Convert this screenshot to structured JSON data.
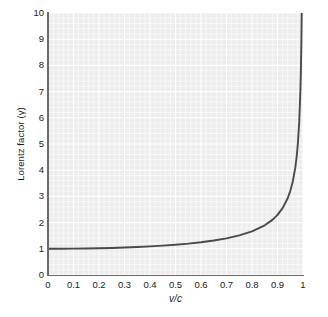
{
  "chart_data": {
    "type": "line",
    "title": "",
    "subtitle": "",
    "xlabel": "v/c",
    "ylabel": "Lorentz factor (γ)",
    "xlim": [
      0,
      1
    ],
    "ylim": [
      0,
      10
    ],
    "grid": true,
    "minor_grid": true,
    "legend": "none",
    "background_color": "#ededed",
    "line_color": "#4a4a4a",
    "axis_color": "#6b6b6b",
    "grid_color": "#ffffff",
    "xticks": [
      "0",
      "0.1",
      "0.2",
      "0.3",
      "0.4",
      "0.5",
      "0.6",
      "0.7",
      "0.8",
      "0.9",
      "1"
    ],
    "xtick_values": [
      0,
      0.1,
      0.2,
      0.3,
      0.4,
      0.5,
      0.6,
      0.7,
      0.8,
      0.9,
      1
    ],
    "yticks": [
      "0",
      "1",
      "2",
      "3",
      "4",
      "5",
      "6",
      "7",
      "8",
      "9",
      "10"
    ],
    "ytick_values": [
      0,
      1,
      2,
      3,
      4,
      5,
      6,
      7,
      8,
      9,
      10
    ],
    "series": [
      {
        "name": "Lorentz factor",
        "equation": "gamma = 1 / sqrt(1 - (v/c)^2)",
        "x": [
          0,
          0.05,
          0.1,
          0.15,
          0.2,
          0.25,
          0.3,
          0.35,
          0.4,
          0.45,
          0.5,
          0.55,
          0.6,
          0.65,
          0.7,
          0.75,
          0.8,
          0.85,
          0.88,
          0.9,
          0.92,
          0.94,
          0.95,
          0.96,
          0.97,
          0.975,
          0.98,
          0.985,
          0.99,
          0.992,
          0.994,
          0.995,
          0.9955
        ],
        "y": [
          1.0,
          1.001,
          1.005,
          1.011,
          1.021,
          1.033,
          1.048,
          1.068,
          1.091,
          1.12,
          1.155,
          1.197,
          1.25,
          1.316,
          1.4,
          1.512,
          1.667,
          1.898,
          2.105,
          2.294,
          2.552,
          2.931,
          3.203,
          3.571,
          4.113,
          4.5,
          5.025,
          5.799,
          7.089,
          7.934,
          9.141,
          10.01,
          10.6
        ]
      }
    ]
  }
}
